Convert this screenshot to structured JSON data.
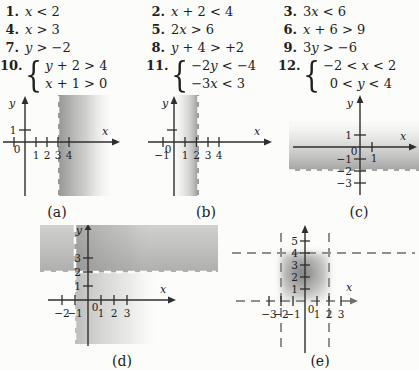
{
  "colors": {
    "page_bg": "#fcfcfa",
    "ink": "#222222",
    "shade_gray": "#7f7f7f",
    "boundary_dash_white": "#fbfbf9",
    "boundary_dash_gray": "#8f8f8f"
  },
  "exercises": {
    "brace": "{",
    "items": [
      {
        "num": "1.",
        "expr": "x < 2"
      },
      {
        "num": "2.",
        "expr": "x + 2 < 4"
      },
      {
        "num": "3.",
        "expr": "3x < 6"
      },
      {
        "num": "4.",
        "expr": "x > 3"
      },
      {
        "num": "5.",
        "expr": "2x > 6"
      },
      {
        "num": "6.",
        "expr": "x + 6 > 9"
      },
      {
        "num": "7.",
        "expr": "y > −2"
      },
      {
        "num": "8.",
        "expr": "y + 4 > +2"
      },
      {
        "num": "9.",
        "expr": "3y > −6"
      },
      {
        "num": "10.",
        "lines": [
          "y + 2 > 4",
          "x + 1 > 0"
        ]
      },
      {
        "num": "11.",
        "lines": [
          "−2y < −4",
          "−3x < 3"
        ]
      },
      {
        "num": "12.",
        "lines": [
          "−2 < x < 2",
          " 0 < y < 4"
        ]
      }
    ]
  },
  "graphs": {
    "a": {
      "caption": "(a)",
      "x_label": "x",
      "y_label": "y",
      "origin": "0",
      "x_tick_labels": [
        "1",
        "2",
        "3",
        "4"
      ],
      "y_tick_labels": [
        "1"
      ]
    },
    "b": {
      "caption": "(b)",
      "x_label": "x",
      "y_label": "y",
      "origin": "0",
      "x_tick_labels": [
        "−1",
        "1",
        "2",
        "3",
        "4"
      ],
      "y_tick_labels": []
    },
    "c": {
      "caption": "(c)",
      "x_label": "x",
      "y_label": "y",
      "origin": "0",
      "x_tick_labels": [
        "1"
      ],
      "y_tick_labels": [
        "1",
        "−1",
        "−2",
        "−3"
      ]
    },
    "d": {
      "caption": "(d)",
      "x_label": "x",
      "y_label": "y",
      "origin": "0",
      "x_tick_labels": [
        "−2",
        "−1",
        "1",
        "2",
        "3"
      ],
      "y_tick_labels": [
        "3",
        "2",
        "1"
      ]
    },
    "e": {
      "caption": "(e)",
      "x_label": "x",
      "origin": "0",
      "x_tick_labels": [
        "−3",
        "−2",
        "−1",
        "1",
        "2",
        "3"
      ],
      "y_tick_labels": [
        "5",
        "4",
        "3",
        "2",
        "1"
      ]
    }
  },
  "chart_data": [
    {
      "id": "a",
      "type": "region-plot",
      "x_ticks": [
        1,
        2,
        3,
        4
      ],
      "y_ticks": [
        1
      ],
      "boundary_lines": [
        {
          "axis": "x",
          "value": 3,
          "style": "dashed"
        }
      ],
      "shaded_region": "x > 3 (shading right of dashed line, fading rightward)"
    },
    {
      "id": "b",
      "type": "region-plot",
      "x_ticks": [
        -1,
        1,
        2,
        3,
        4
      ],
      "y_ticks": [
        1
      ],
      "boundary_lines": [
        {
          "axis": "x",
          "value": 2,
          "style": "dashed"
        }
      ],
      "shaded_region": "x < 2 (shading left of dashed line, fading leftward)"
    },
    {
      "id": "c",
      "type": "region-plot",
      "x_ticks": [
        1
      ],
      "y_ticks": [
        1,
        -1,
        -2,
        -3
      ],
      "boundary_lines": [
        {
          "axis": "y",
          "value": -2,
          "style": "dashed"
        }
      ],
      "shaded_region": "y > −2 (shading above dashed line, fading upward)"
    },
    {
      "id": "d",
      "type": "region-plot",
      "x_ticks": [
        -2,
        -1,
        1,
        2,
        3
      ],
      "y_ticks": [
        1,
        2,
        3
      ],
      "boundary_lines": [
        {
          "axis": "x",
          "value": -1,
          "style": "dashed"
        },
        {
          "axis": "y",
          "value": 2,
          "style": "dashed"
        }
      ],
      "shaded_region": "x > −1 and y > 2 (overlapping gradient bands, darkest in overlap)"
    },
    {
      "id": "e",
      "type": "region-plot",
      "x_ticks": [
        -3,
        -2,
        -1,
        1,
        2,
        3
      ],
      "y_ticks": [
        1,
        2,
        3,
        4,
        5
      ],
      "boundary_lines": [
        {
          "axis": "x",
          "value": -2,
          "style": "dashed"
        },
        {
          "axis": "x",
          "value": 2,
          "style": "dashed"
        },
        {
          "axis": "y",
          "value": 0,
          "style": "dashed"
        },
        {
          "axis": "y",
          "value": 4,
          "style": "dashed"
        }
      ],
      "shaded_region": "−2 < x < 2 and 0 < y < 4 (shaded rectangle, darkest at center)"
    }
  ]
}
